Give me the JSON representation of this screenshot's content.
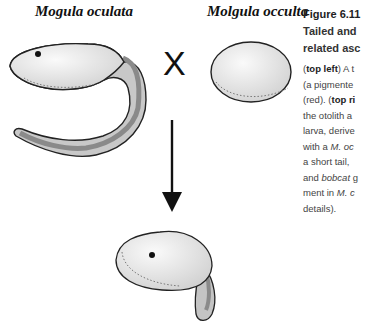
{
  "figure": {
    "number": "Figure 6.11",
    "title_line1": "Tailed and",
    "title_line2": "related asc",
    "body_lines": [
      {
        "pre": "(",
        "bold": "top left",
        "post": ") A t"
      },
      {
        "pre": "(a pigmente",
        "bold": "",
        "post": ""
      },
      {
        "pre": "(red). (",
        "bold": "top ri",
        "post": ""
      },
      {
        "pre": "the otolith a",
        "bold": "",
        "post": ""
      },
      {
        "pre": "larva, derive",
        "bold": "",
        "post": ""
      },
      {
        "pre": "with a ",
        "italic": "M. oc",
        "post": ""
      },
      {
        "pre": "a short tail, ",
        "bold": "",
        "post": ""
      },
      {
        "pre": "and ",
        "italic": "bobcat",
        "post": " g"
      },
      {
        "pre": "ment in ",
        "italic": "M. c",
        "post": ""
      },
      {
        "pre": "details).",
        "bold": "",
        "post": ""
      }
    ]
  },
  "labels": {
    "left_species": "Mogula oculata",
    "right_species": "Molgula occulta",
    "cross_symbol": "X"
  },
  "colors": {
    "body_fill": "#e6e6e6",
    "tail_fill": "#bdbdbd",
    "notochord_stripe": "#8a8a8a",
    "outline": "#222222"
  }
}
